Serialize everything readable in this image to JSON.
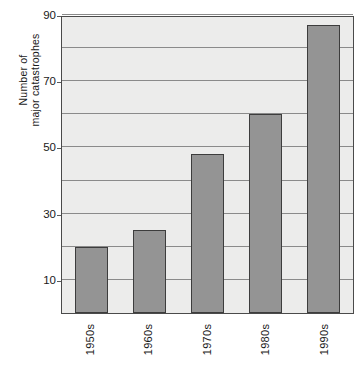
{
  "chart_data": {
    "type": "bar",
    "title": "",
    "xlabel": "",
    "ylabel": "Number of major catastrophes",
    "ylabel_line1": "Number of",
    "ylabel_line2": "major catastrophes",
    "categories": [
      "1950s",
      "1960s",
      "1970s",
      "1980s",
      "1990s"
    ],
    "values": [
      20,
      25,
      48,
      60,
      87
    ],
    "ylim": [
      0,
      90
    ],
    "y_tick_labels": [
      "10",
      "30",
      "50",
      "70",
      "90"
    ],
    "y_tick_values": [
      10,
      30,
      50,
      70,
      90
    ],
    "gridline_values": [
      10,
      20,
      30,
      40,
      50,
      60,
      70,
      80,
      90
    ],
    "grid": true,
    "legend": "none",
    "colors": {
      "bar_fill": "#949494",
      "bar_stroke": "#3d3d3d",
      "plot_background": "#ececeb",
      "gridline": "#8a8a8a",
      "axis": "#4a4a4a",
      "text": "#1a1a1a"
    }
  }
}
